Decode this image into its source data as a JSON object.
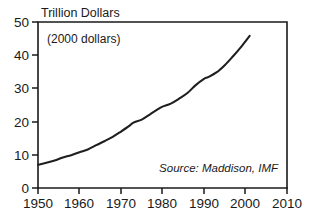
{
  "chart_data": {
    "type": "line",
    "title": "Trillion Dollars",
    "subtitle": "(2000 dollars)",
    "source_note": "Source: Maddison, IMF",
    "xlabel": "",
    "ylabel": "Trillion Dollars",
    "xlim": [
      1950,
      2010
    ],
    "ylim": [
      0,
      50
    ],
    "grid": false,
    "legend": "none",
    "xticks": [
      1950,
      1960,
      1970,
      1980,
      1990,
      2000,
      2010
    ],
    "xtick_labels": [
      "1950",
      "1960",
      "1970",
      "1980",
      "1990",
      "2000",
      "2010"
    ],
    "yticks": [
      0,
      10,
      20,
      30,
      40,
      50
    ],
    "ytick_labels": [
      "0",
      "10",
      "20",
      "30",
      "40",
      "50"
    ],
    "series": [
      {
        "name": "World GDP",
        "x": [
          1950,
          1952,
          1954,
          1956,
          1958,
          1960,
          1962,
          1964,
          1966,
          1968,
          1970,
          1972,
          1973,
          1975,
          1977,
          1979,
          1980,
          1982,
          1984,
          1986,
          1988,
          1990,
          1991,
          1993,
          1995,
          1997,
          1999,
          2001
        ],
        "values": [
          7.0,
          7.6,
          8.3,
          9.2,
          9.9,
          10.8,
          11.6,
          12.9,
          14.1,
          15.4,
          17.0,
          18.7,
          19.7,
          20.6,
          22.2,
          23.8,
          24.5,
          25.4,
          26.9,
          28.6,
          31.0,
          32.9,
          33.4,
          34.8,
          37.0,
          39.7,
          42.6,
          45.8
        ]
      }
    ]
  },
  "axis": {
    "title_anchor": "Trillion Dollars"
  }
}
